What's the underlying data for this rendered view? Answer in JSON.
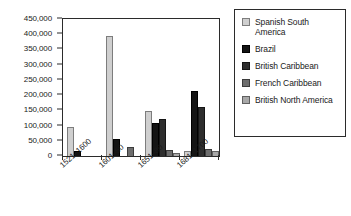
{
  "chart_data": {
    "type": "bar",
    "title": "",
    "xlabel": "",
    "ylabel": "",
    "ylim": [
      0,
      450000
    ],
    "ytick_step": 50000,
    "grid": false,
    "legend_position": "right",
    "categories": [
      "1521–1600",
      "1601–50",
      "1651–80",
      "1681–1700"
    ],
    "ytick_labels": [
      "0",
      "50,000",
      "100,000",
      "150,000",
      "200,000",
      "250,000",
      "300,000",
      "350,000",
      "400,000",
      "450,000"
    ],
    "ytick_values": [
      0,
      50000,
      100000,
      150000,
      200000,
      250000,
      300000,
      350000,
      400000,
      450000
    ],
    "series": [
      {
        "name": "Spanish South America",
        "color": "#cfcfcf",
        "values": [
          95000,
          395000,
          147000,
          15000
        ]
      },
      {
        "name": "Brazil",
        "color": "#141414",
        "values": [
          18000,
          57000,
          108000,
          215000
        ]
      },
      {
        "name": "British Caribbean",
        "color": "#2e2e2e",
        "values": [
          0,
          0,
          122000,
          160000
        ]
      },
      {
        "name": "French Caribbean",
        "color": "#6e6e6e",
        "values": [
          0,
          30000,
          20000,
          22000
        ]
      },
      {
        "name": "British North America",
        "color": "#a8a8a8",
        "values": [
          0,
          0,
          10000,
          18000
        ]
      }
    ]
  },
  "legend": {
    "items": [
      {
        "label": "Spanish South America"
      },
      {
        "label": "Brazil"
      },
      {
        "label": "British Caribbean"
      },
      {
        "label": "French Caribbean"
      },
      {
        "label": "British North America"
      }
    ]
  }
}
